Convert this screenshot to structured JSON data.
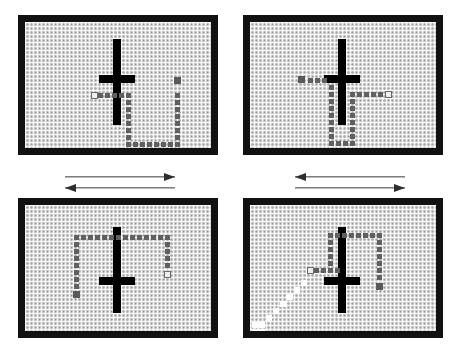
{
  "figure": {
    "grid": {
      "cell_size_px": 4,
      "background_color": "#d4d4d4",
      "border_color": "#111111",
      "visited_color": "#606060",
      "start_marker_color": "#eeeeee",
      "goal_marker_color": "#5a5a5a",
      "trail_color": "#ffffff",
      "obstacle_color": "#000000"
    },
    "panels": [
      {
        "id": "panel-top-left",
        "name": "panel-1",
        "x": 18,
        "y": 15,
        "w": 200,
        "h": 140,
        "border": 7,
        "obstacle": {
          "name": "cross-obstacle",
          "vertical": {
            "x": 88,
            "y": 17,
            "w": 8,
            "h": 86
          },
          "horizontal": {
            "x": 74,
            "y": 53,
            "w": 36,
            "h": 8
          }
        },
        "path": [
          {
            "x": 66,
            "y": 70,
            "type": "start-open"
          },
          {
            "x": 73,
            "y": 71,
            "type": "visited"
          },
          {
            "x": 80,
            "y": 71,
            "type": "visited"
          },
          {
            "x": 87,
            "y": 71,
            "type": "visited"
          },
          {
            "x": 94,
            "y": 71,
            "type": "visited"
          },
          {
            "x": 101,
            "y": 71,
            "type": "visited"
          },
          {
            "x": 101,
            "y": 78,
            "type": "visited"
          },
          {
            "x": 101,
            "y": 85,
            "type": "visited"
          },
          {
            "x": 101,
            "y": 92,
            "type": "visited"
          },
          {
            "x": 101,
            "y": 99,
            "type": "visited"
          },
          {
            "x": 101,
            "y": 106,
            "type": "visited"
          },
          {
            "x": 101,
            "y": 113,
            "type": "visited"
          },
          {
            "x": 101,
            "y": 120,
            "type": "visited"
          },
          {
            "x": 108,
            "y": 120,
            "type": "visited"
          },
          {
            "x": 115,
            "y": 120,
            "type": "visited"
          },
          {
            "x": 122,
            "y": 120,
            "type": "visited"
          },
          {
            "x": 129,
            "y": 120,
            "type": "visited"
          },
          {
            "x": 136,
            "y": 120,
            "type": "visited"
          },
          {
            "x": 143,
            "y": 120,
            "type": "visited"
          },
          {
            "x": 150,
            "y": 120,
            "type": "visited"
          },
          {
            "x": 150,
            "y": 113,
            "type": "visited"
          },
          {
            "x": 150,
            "y": 106,
            "type": "visited"
          },
          {
            "x": 150,
            "y": 99,
            "type": "visited"
          },
          {
            "x": 150,
            "y": 92,
            "type": "visited"
          },
          {
            "x": 150,
            "y": 85,
            "type": "visited"
          },
          {
            "x": 150,
            "y": 78,
            "type": "visited"
          },
          {
            "x": 150,
            "y": 71,
            "type": "visited"
          },
          {
            "x": 149,
            "y": 55,
            "type": "goal-filled"
          }
        ]
      },
      {
        "id": "panel-top-right",
        "name": "panel-2",
        "x": 243,
        "y": 15,
        "w": 200,
        "h": 140,
        "border": 7,
        "obstacle": {
          "name": "cross-obstacle",
          "vertical": {
            "x": 88,
            "y": 17,
            "w": 8,
            "h": 86
          },
          "horizontal": {
            "x": 74,
            "y": 53,
            "w": 36,
            "h": 8
          }
        },
        "path": [
          {
            "x": 48,
            "y": 54,
            "type": "goal-filled"
          },
          {
            "x": 58,
            "y": 56,
            "type": "visited"
          },
          {
            "x": 65,
            "y": 56,
            "type": "visited"
          },
          {
            "x": 72,
            "y": 56,
            "type": "visited"
          },
          {
            "x": 79,
            "y": 63,
            "type": "visited"
          },
          {
            "x": 79,
            "y": 70,
            "type": "visited"
          },
          {
            "x": 79,
            "y": 77,
            "type": "visited"
          },
          {
            "x": 79,
            "y": 84,
            "type": "visited"
          },
          {
            "x": 79,
            "y": 91,
            "type": "visited"
          },
          {
            "x": 79,
            "y": 98,
            "type": "visited"
          },
          {
            "x": 79,
            "y": 105,
            "type": "visited"
          },
          {
            "x": 79,
            "y": 112,
            "type": "visited"
          },
          {
            "x": 79,
            "y": 119,
            "type": "visited"
          },
          {
            "x": 86,
            "y": 119,
            "type": "visited"
          },
          {
            "x": 93,
            "y": 119,
            "type": "visited"
          },
          {
            "x": 100,
            "y": 119,
            "type": "visited"
          },
          {
            "x": 100,
            "y": 112,
            "type": "visited"
          },
          {
            "x": 100,
            "y": 105,
            "type": "visited"
          },
          {
            "x": 100,
            "y": 98,
            "type": "visited"
          },
          {
            "x": 100,
            "y": 91,
            "type": "visited"
          },
          {
            "x": 100,
            "y": 84,
            "type": "visited"
          },
          {
            "x": 100,
            "y": 77,
            "type": "visited"
          },
          {
            "x": 100,
            "y": 70,
            "type": "visited"
          },
          {
            "x": 107,
            "y": 70,
            "type": "visited"
          },
          {
            "x": 114,
            "y": 70,
            "type": "visited"
          },
          {
            "x": 121,
            "y": 70,
            "type": "visited"
          },
          {
            "x": 128,
            "y": 70,
            "type": "visited"
          },
          {
            "x": 135,
            "y": 69,
            "type": "start-open"
          }
        ]
      },
      {
        "id": "panel-bottom-left",
        "name": "panel-3",
        "x": 18,
        "y": 198,
        "w": 200,
        "h": 140,
        "border": 7,
        "obstacle": {
          "name": "cross-obstacle",
          "vertical": {
            "x": 88,
            "y": 22,
            "w": 8,
            "h": 86
          },
          "horizontal": {
            "x": 74,
            "y": 72,
            "w": 36,
            "h": 8
          }
        },
        "path": [
          {
            "x": 48,
            "y": 86,
            "type": "goal-filled"
          },
          {
            "x": 49,
            "y": 79,
            "type": "visited"
          },
          {
            "x": 49,
            "y": 72,
            "type": "visited"
          },
          {
            "x": 49,
            "y": 65,
            "type": "visited"
          },
          {
            "x": 49,
            "y": 58,
            "type": "visited"
          },
          {
            "x": 49,
            "y": 51,
            "type": "visited"
          },
          {
            "x": 49,
            "y": 44,
            "type": "visited"
          },
          {
            "x": 49,
            "y": 37,
            "type": "visited"
          },
          {
            "x": 49,
            "y": 30,
            "type": "visited"
          },
          {
            "x": 56,
            "y": 30,
            "type": "visited"
          },
          {
            "x": 63,
            "y": 30,
            "type": "visited"
          },
          {
            "x": 70,
            "y": 30,
            "type": "visited"
          },
          {
            "x": 77,
            "y": 30,
            "type": "visited"
          },
          {
            "x": 84,
            "y": 30,
            "type": "visited"
          },
          {
            "x": 91,
            "y": 30,
            "type": "visited"
          },
          {
            "x": 98,
            "y": 30,
            "type": "visited"
          },
          {
            "x": 105,
            "y": 30,
            "type": "visited"
          },
          {
            "x": 112,
            "y": 30,
            "type": "visited"
          },
          {
            "x": 119,
            "y": 30,
            "type": "visited"
          },
          {
            "x": 126,
            "y": 30,
            "type": "visited"
          },
          {
            "x": 133,
            "y": 30,
            "type": "visited"
          },
          {
            "x": 140,
            "y": 30,
            "type": "visited"
          },
          {
            "x": 140,
            "y": 37,
            "type": "visited"
          },
          {
            "x": 140,
            "y": 44,
            "type": "visited"
          },
          {
            "x": 140,
            "y": 51,
            "type": "visited"
          },
          {
            "x": 140,
            "y": 58,
            "type": "visited"
          },
          {
            "x": 139,
            "y": 66,
            "type": "start-open"
          }
        ]
      },
      {
        "id": "panel-bottom-right",
        "name": "panel-4",
        "x": 243,
        "y": 198,
        "w": 200,
        "h": 140,
        "border": 7,
        "obstacle": {
          "name": "cross-obstacle",
          "vertical": {
            "x": 88,
            "y": 22,
            "w": 8,
            "h": 86
          },
          "horizontal": {
            "x": 74,
            "y": 72,
            "w": 36,
            "h": 8
          }
        },
        "path": [
          {
            "x": 57,
            "y": 62,
            "type": "start-open"
          },
          {
            "x": 64,
            "y": 63,
            "type": "visited"
          },
          {
            "x": 71,
            "y": 63,
            "type": "visited"
          },
          {
            "x": 78,
            "y": 63,
            "type": "visited"
          },
          {
            "x": 85,
            "y": 63,
            "type": "visited"
          },
          {
            "x": 78,
            "y": 56,
            "type": "visited"
          },
          {
            "x": 78,
            "y": 49,
            "type": "visited"
          },
          {
            "x": 78,
            "y": 42,
            "type": "visited"
          },
          {
            "x": 78,
            "y": 35,
            "type": "visited"
          },
          {
            "x": 78,
            "y": 28,
            "type": "visited"
          },
          {
            "x": 85,
            "y": 28,
            "type": "visited"
          },
          {
            "x": 92,
            "y": 28,
            "type": "visited"
          },
          {
            "x": 99,
            "y": 28,
            "type": "visited"
          },
          {
            "x": 106,
            "y": 28,
            "type": "visited"
          },
          {
            "x": 113,
            "y": 28,
            "type": "visited"
          },
          {
            "x": 120,
            "y": 28,
            "type": "visited"
          },
          {
            "x": 127,
            "y": 28,
            "type": "visited"
          },
          {
            "x": 127,
            "y": 35,
            "type": "visited"
          },
          {
            "x": 127,
            "y": 42,
            "type": "visited"
          },
          {
            "x": 127,
            "y": 49,
            "type": "visited"
          },
          {
            "x": 127,
            "y": 56,
            "type": "visited"
          },
          {
            "x": 127,
            "y": 63,
            "type": "visited"
          },
          {
            "x": 127,
            "y": 70,
            "type": "visited"
          },
          {
            "x": 126,
            "y": 78,
            "type": "goal-filled"
          }
        ],
        "trail": [
          {
            "x": 2,
            "y": 124,
            "type": "white-trail"
          },
          {
            "x": 9,
            "y": 124,
            "type": "white-trail"
          },
          {
            "x": 2,
            "y": 117,
            "type": "white-trail"
          },
          {
            "x": 9,
            "y": 117,
            "type": "white-trail"
          },
          {
            "x": 16,
            "y": 110,
            "type": "white-trail"
          },
          {
            "x": 23,
            "y": 103,
            "type": "white-trail"
          },
          {
            "x": 30,
            "y": 96,
            "type": "white-trail"
          },
          {
            "x": 37,
            "y": 89,
            "type": "white-trail"
          },
          {
            "x": 44,
            "y": 82,
            "type": "white-trail"
          },
          {
            "x": 51,
            "y": 75,
            "type": "white-trail"
          }
        ]
      }
    ],
    "arrows": [
      {
        "id": "arrow-left-top",
        "name": "arrow-right-1",
        "x": 65,
        "y": 172,
        "w": 110,
        "direction": "right"
      },
      {
        "id": "arrow-left-bottom",
        "name": "arrow-left-1",
        "x": 65,
        "y": 183,
        "w": 110,
        "direction": "left"
      },
      {
        "id": "arrow-right-top",
        "name": "arrow-left-2",
        "x": 295,
        "y": 172,
        "w": 110,
        "direction": "left"
      },
      {
        "id": "arrow-right-bottom",
        "name": "arrow-right-2",
        "x": 295,
        "y": 183,
        "w": 110,
        "direction": "right"
      }
    ]
  }
}
